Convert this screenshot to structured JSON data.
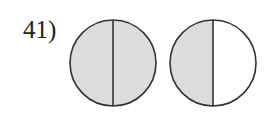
{
  "problem": {
    "number_label": "41)",
    "figures": [
      {
        "name": "circle-1",
        "cx": 113,
        "cy": 63,
        "r": 43,
        "shaded_halves": [
          "left",
          "right"
        ],
        "fraction": "2/2"
      },
      {
        "name": "circle-2",
        "cx": 213,
        "cy": 63,
        "r": 43,
        "shaded_halves": [
          "left"
        ],
        "fraction": "1/2"
      }
    ],
    "colors": {
      "shade": "#dcdcdc",
      "stroke": "#333333",
      "background": "#ffffff"
    }
  }
}
